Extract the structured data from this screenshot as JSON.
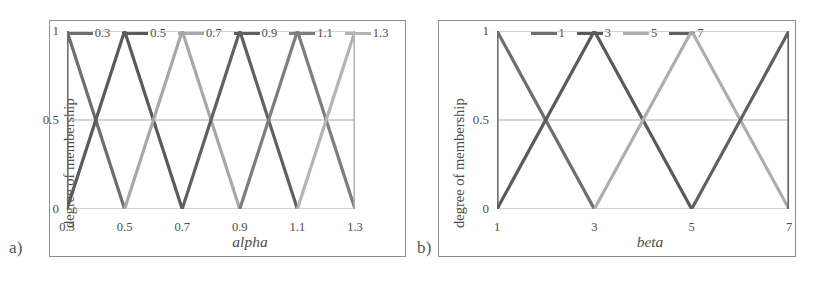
{
  "figure": {
    "panel_a_label": "a)",
    "panel_b_label": "b)",
    "background": "#ffffff",
    "frame_color": "#8d8d8d"
  },
  "chart_data": [
    {
      "type": "line",
      "title": "",
      "panel": "a)",
      "xlabel": "alpha",
      "ylabel": "degree of membership",
      "xlim": [
        0.3,
        1.3
      ],
      "ylim": [
        0,
        1
      ],
      "grid": true,
      "gridlines_y": [
        0,
        0.5,
        1
      ],
      "legend_position": "top",
      "xticks": [
        "0.3",
        "0.5",
        "0.7",
        "0.9",
        "1.1",
        "1.3"
      ],
      "xtick_values": [
        0.3,
        0.5,
        0.7,
        0.9,
        1.1,
        1.3
      ],
      "yticks": [
        "0",
        "0.5",
        "1"
      ],
      "ytick_values": [
        0,
        0.5,
        1
      ],
      "series": [
        {
          "name": "0.3",
          "color": "#6e6e6e",
          "x": [
            0.3,
            0.3,
            0.5
          ],
          "values": [
            0,
            1,
            0
          ]
        },
        {
          "name": "0.5",
          "color": "#5a5a5a",
          "x": [
            0.3,
            0.5,
            0.7
          ],
          "values": [
            0,
            1,
            0
          ]
        },
        {
          "name": "0.7",
          "color": "#a8a8a8",
          "x": [
            0.5,
            0.7,
            0.9
          ],
          "values": [
            0,
            1,
            0
          ]
        },
        {
          "name": "0.9",
          "color": "#606060",
          "x": [
            0.7,
            0.9,
            1.1
          ],
          "values": [
            0,
            1,
            0
          ]
        },
        {
          "name": "1.1",
          "color": "#7d7d7d",
          "x": [
            0.9,
            1.1,
            1.3
          ],
          "values": [
            0,
            1,
            0
          ]
        },
        {
          "name": "1.3",
          "color": "#b4b4b4",
          "x": [
            1.1,
            1.3,
            1.3
          ],
          "values": [
            0,
            1,
            0
          ]
        }
      ]
    },
    {
      "type": "line",
      "title": "",
      "panel": "b)",
      "xlabel": "beta",
      "ylabel": "degree of membership",
      "xlim": [
        1,
        7
      ],
      "ylim": [
        0,
        1
      ],
      "grid": true,
      "gridlines_y": [
        0,
        0.5,
        1
      ],
      "legend_position": "top",
      "xticks": [
        "1",
        "3",
        "5",
        "7"
      ],
      "xtick_values": [
        1,
        3,
        5,
        7
      ],
      "yticks": [
        "0",
        "0.5",
        "1"
      ],
      "ytick_values": [
        0,
        0.5,
        1
      ],
      "series": [
        {
          "name": "1",
          "color": "#6e6e6e",
          "x": [
            1,
            1,
            3
          ],
          "values": [
            0,
            1,
            0
          ]
        },
        {
          "name": "3",
          "color": "#5a5a5a",
          "x": [
            1,
            3,
            5
          ],
          "values": [
            0,
            1,
            0
          ]
        },
        {
          "name": "5",
          "color": "#aeaeae",
          "x": [
            3,
            5,
            7
          ],
          "values": [
            0,
            1,
            0
          ]
        },
        {
          "name": "7",
          "color": "#606060",
          "x": [
            5,
            7,
            7
          ],
          "values": [
            0,
            1,
            0
          ]
        }
      ]
    }
  ]
}
